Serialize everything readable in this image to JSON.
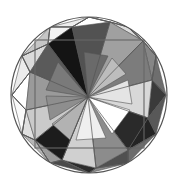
{
  "figure": {
    "title": "Tessellated Circle Mosaic",
    "type": "geometric-mosaic",
    "canvas": {
      "width": 177,
      "height": 180,
      "background": "#ffffff"
    },
    "circle": {
      "cx": 89,
      "cy": 95,
      "r": 78,
      "stroke": "#555555",
      "stroke_width": 1.2,
      "fill": "#ffffff"
    },
    "square_outline": {
      "x": 35,
      "y": 40,
      "width": 109,
      "height": 108,
      "stroke": "#666666",
      "stroke_width": 1.1,
      "fill": "none"
    },
    "hub": {
      "x": 88,
      "y": 97
    },
    "palette": {
      "white": "#ffffff",
      "near_white": "#f4f4f4",
      "light_1": "#e6e6e6",
      "light_2": "#d4d4d4",
      "light_3": "#c2c2c2",
      "mid_1": "#a8a8a8",
      "mid_2": "#949494",
      "mid_3": "#808080",
      "dark_1": "#5e5e5e",
      "dark_2": "#464646",
      "dark_3": "#2e2e2e",
      "black": "#141414",
      "stroke": "#555555"
    },
    "inner_ring_label": "hexagonal fan of 12 triangles radiating from hub",
    "outer_ring_label": "dodecagonal ring of alternating triangles",
    "inner_polygon": {
      "sides": 12,
      "vertices": [
        [
          89,
          17
        ],
        [
          128,
          27
        ],
        [
          156,
          56
        ],
        [
          166,
          95
        ],
        [
          156,
          134
        ],
        [
          128,
          163
        ],
        [
          89,
          173
        ],
        [
          50,
          163
        ],
        [
          22,
          134
        ],
        [
          12,
          95
        ],
        [
          22,
          56
        ],
        [
          50,
          27
        ]
      ]
    },
    "inner_fan_triangles": [
      {
        "name": "fan-n-nne",
        "points": "88,97 72,27 110,22",
        "fill": "#525252"
      },
      {
        "name": "fan-nne-ne",
        "points": "88,97 110,22 143,41",
        "fill": "#a0a0a0"
      },
      {
        "name": "fan-ne-e",
        "points": "88,97 143,41 152,80",
        "fill": "#7c7c7c"
      },
      {
        "name": "fan-e-ese",
        "points": "88,97 152,80 148,118",
        "fill": "#d8d8d8"
      },
      {
        "name": "fan-ese-se",
        "points": "88,97 148,118 128,150",
        "fill": "#2a2a2a"
      },
      {
        "name": "fan-se-s",
        "points": "88,97 128,150 96,168",
        "fill": "#8c8c8c"
      },
      {
        "name": "fan-s-ssw",
        "points": "88,97 96,168 62,160",
        "fill": "#d0d0d0"
      },
      {
        "name": "fan-ssw-sw",
        "points": "88,97 62,160 35,140",
        "fill": "#1c1c1c"
      },
      {
        "name": "fan-sw-w",
        "points": "88,97 35,140 26,110",
        "fill": "#cacaca"
      },
      {
        "name": "fan-w-wnw",
        "points": "88,97 26,110 30,72",
        "fill": "#9a9a9a"
      },
      {
        "name": "fan-wnw-nw",
        "points": "88,97 30,72 48,44",
        "fill": "#5a5a5a"
      },
      {
        "name": "fan-nw-n",
        "points": "88,97 48,44 72,27",
        "fill": "#141414"
      }
    ],
    "hub_wedges": [
      {
        "name": "wedge-a",
        "points": "88,97 108,56 84,52",
        "fill": "#6a6a6a"
      },
      {
        "name": "wedge-b",
        "points": "88,97 126,74 112,58",
        "fill": "#bdbdbd"
      },
      {
        "name": "wedge-c",
        "points": "88,97 132,104 128,80",
        "fill": "#e4e4e4"
      },
      {
        "name": "wedge-d",
        "points": "88,97 112,134 130,110",
        "fill": "#ffffff"
      },
      {
        "name": "wedge-e",
        "points": "88,97 76,140 106,138",
        "fill": "#efefef"
      },
      {
        "name": "wedge-f",
        "points": "88,97 52,124 70,140",
        "fill": "#b2b2b2"
      },
      {
        "name": "wedge-g",
        "points": "88,97 46,96 50,120",
        "fill": "#8e8e8e"
      },
      {
        "name": "wedge-h",
        "points": "88,97 58,62 46,90",
        "fill": "#7a7a7a"
      }
    ],
    "outer_ring_triangles": [
      {
        "name": "ring-n-left",
        "points": "72,27 89,17 89,17",
        "fill": "#ffffff"
      },
      {
        "name": "ring-t01",
        "points": "50,27 89,17 72,27",
        "fill": "#ededed"
      },
      {
        "name": "ring-t02",
        "points": "89,17 110,22 128,27",
        "fill": "#fafafa"
      },
      {
        "name": "ring-t03",
        "points": "128,27 110,22 143,41",
        "fill": "#dcdcdc"
      },
      {
        "name": "ring-t04",
        "points": "128,27 143,41 156,56",
        "fill": "#c8c8c8"
      },
      {
        "name": "ring-t05",
        "points": "156,56 143,41 152,80",
        "fill": "#868686"
      },
      {
        "name": "ring-t06",
        "points": "156,56 152,80 166,95",
        "fill": "#6e6e6e"
      },
      {
        "name": "ring-t07",
        "points": "166,95 152,80 148,118",
        "fill": "#3a3a3a"
      },
      {
        "name": "ring-t08",
        "points": "166,95 148,118 156,134",
        "fill": "#585858"
      },
      {
        "name": "ring-t09",
        "points": "156,134 148,118 128,150",
        "fill": "#242424"
      },
      {
        "name": "ring-t10",
        "points": "156,134 128,150 128,163",
        "fill": "#6c6c6c"
      },
      {
        "name": "ring-t11",
        "points": "128,163 128,150 96,168",
        "fill": "#505050"
      },
      {
        "name": "ring-t12",
        "points": "128,163 96,168 89,173",
        "fill": "#8a8a8a"
      },
      {
        "name": "ring-t13",
        "points": "89,173 96,168 62,160",
        "fill": "#2c2c2c"
      },
      {
        "name": "ring-t14",
        "points": "89,173 62,160 50,163",
        "fill": "#4a4a4a"
      },
      {
        "name": "ring-t15",
        "points": "50,163 62,160 35,140",
        "fill": "#9c9c9c"
      },
      {
        "name": "ring-t16",
        "points": "50,163 35,140 22,134",
        "fill": "#b6b6b6"
      },
      {
        "name": "ring-t17",
        "points": "22,134 35,140 26,110",
        "fill": "#e0e0e0"
      },
      {
        "name": "ring-t18",
        "points": "22,134 26,110 12,95",
        "fill": "#fafafa"
      },
      {
        "name": "ring-t19",
        "points": "12,95 26,110 30,72",
        "fill": "#ffffff"
      },
      {
        "name": "ring-t20",
        "points": "12,95 30,72 22,56",
        "fill": "#ececec"
      },
      {
        "name": "ring-t21",
        "points": "22,56 30,72 48,44",
        "fill": "#dadada"
      },
      {
        "name": "ring-t22",
        "points": "22,56 48,44 50,27",
        "fill": "#c6c6c6"
      },
      {
        "name": "ring-t23",
        "points": "50,27 48,44 72,27",
        "fill": "#f2f2f2"
      }
    ],
    "edge_lines": [
      {
        "name": "edge-hub-n",
        "x1": 88,
        "y1": 97,
        "x2": 72,
        "y2": 27
      },
      {
        "name": "edge-hub-nne",
        "x1": 88,
        "y1": 97,
        "x2": 110,
        "y2": 22
      },
      {
        "name": "edge-hub-ne",
        "x1": 88,
        "y1": 97,
        "x2": 143,
        "y2": 41
      },
      {
        "name": "edge-hub-e",
        "x1": 88,
        "y1": 97,
        "x2": 152,
        "y2": 80
      },
      {
        "name": "edge-hub-ese",
        "x1": 88,
        "y1": 97,
        "x2": 148,
        "y2": 118
      },
      {
        "name": "edge-hub-se",
        "x1": 88,
        "y1": 97,
        "x2": 128,
        "y2": 150
      },
      {
        "name": "edge-hub-s",
        "x1": 88,
        "y1": 97,
        "x2": 96,
        "y2": 168
      },
      {
        "name": "edge-hub-ssw",
        "x1": 88,
        "y1": 97,
        "x2": 62,
        "y2": 160
      },
      {
        "name": "edge-hub-sw",
        "x1": 88,
        "y1": 97,
        "x2": 35,
        "y2": 140
      },
      {
        "name": "edge-hub-w",
        "x1": 88,
        "y1": 97,
        "x2": 26,
        "y2": 110
      },
      {
        "name": "edge-hub-wnw",
        "x1": 88,
        "y1": 97,
        "x2": 30,
        "y2": 72
      },
      {
        "name": "edge-hub-nw",
        "x1": 88,
        "y1": 97,
        "x2": 48,
        "y2": 44
      }
    ],
    "spoke_lines": [
      {
        "name": "spoke-01",
        "x1": 89,
        "y1": 17,
        "x2": 72,
        "y2": 27
      },
      {
        "name": "spoke-02",
        "x1": 89,
        "y1": 17,
        "x2": 110,
        "y2": 22
      },
      {
        "name": "spoke-03",
        "x1": 128,
        "y1": 27,
        "x2": 110,
        "y2": 22
      },
      {
        "name": "spoke-04",
        "x1": 128,
        "y1": 27,
        "x2": 143,
        "y2": 41
      },
      {
        "name": "spoke-05",
        "x1": 156,
        "y1": 56,
        "x2": 143,
        "y2": 41
      },
      {
        "name": "spoke-06",
        "x1": 156,
        "y1": 56,
        "x2": 152,
        "y2": 80
      },
      {
        "name": "spoke-07",
        "x1": 166,
        "y1": 95,
        "x2": 152,
        "y2": 80
      },
      {
        "name": "spoke-08",
        "x1": 166,
        "y1": 95,
        "x2": 148,
        "y2": 118
      },
      {
        "name": "spoke-09",
        "x1": 156,
        "y1": 134,
        "x2": 148,
        "y2": 118
      },
      {
        "name": "spoke-10",
        "x1": 156,
        "y1": 134,
        "x2": 128,
        "y2": 150
      },
      {
        "name": "spoke-11",
        "x1": 128,
        "y1": 163,
        "x2": 128,
        "y2": 150
      },
      {
        "name": "spoke-12",
        "x1": 128,
        "y1": 163,
        "x2": 96,
        "y2": 168
      },
      {
        "name": "spoke-13",
        "x1": 89,
        "y1": 173,
        "x2": 96,
        "y2": 168
      },
      {
        "name": "spoke-14",
        "x1": 89,
        "y1": 173,
        "x2": 62,
        "y2": 160
      },
      {
        "name": "spoke-15",
        "x1": 50,
        "y1": 163,
        "x2": 62,
        "y2": 160
      },
      {
        "name": "spoke-16",
        "x1": 50,
        "y1": 163,
        "x2": 35,
        "y2": 140
      },
      {
        "name": "spoke-17",
        "x1": 22,
        "y1": 134,
        "x2": 35,
        "y2": 140
      },
      {
        "name": "spoke-18",
        "x1": 22,
        "y1": 134,
        "x2": 26,
        "y2": 110
      },
      {
        "name": "spoke-19",
        "x1": 12,
        "y1": 95,
        "x2": 26,
        "y2": 110
      },
      {
        "name": "spoke-20",
        "x1": 12,
        "y1": 95,
        "x2": 30,
        "y2": 72
      },
      {
        "name": "spoke-21",
        "x1": 22,
        "y1": 56,
        "x2": 30,
        "y2": 72
      },
      {
        "name": "spoke-22",
        "x1": 22,
        "y1": 56,
        "x2": 48,
        "y2": 44
      },
      {
        "name": "spoke-23",
        "x1": 50,
        "y1": 27,
        "x2": 48,
        "y2": 44
      },
      {
        "name": "spoke-24",
        "x1": 50,
        "y1": 27,
        "x2": 72,
        "y2": 27
      }
    ],
    "dodecagon_outline": "89,17 110,22 128,27 143,41 156,56 152,80 166,95 148,118 156,134 128,150 128,163 96,168 89,173 62,160 50,163 35,140 22,134 26,110 12,95 30,72 22,56 48,44 50,27 72,27"
  }
}
